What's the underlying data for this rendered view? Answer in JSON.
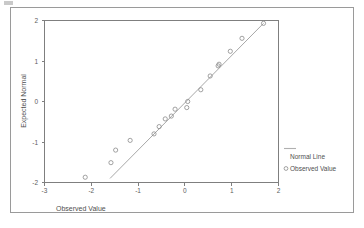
{
  "figure": {
    "background_color": "#ffffff",
    "frame_color": "#9a9a9a",
    "axis_color": "#7f7f7f",
    "marker_color": "#8a8a8a",
    "line_color": "#9d9d9d"
  },
  "legend": {
    "entries": [
      {
        "label": "Normal Line",
        "kind": "line",
        "icon": "line-swatch-icon"
      },
      {
        "label": "Observed Value",
        "kind": "marker",
        "icon": "circle-marker-icon"
      }
    ]
  },
  "chart_data": {
    "type": "scatter",
    "title": "",
    "subtitle": "",
    "xlabel": "Observed Value",
    "ylabel": "Expected Normal",
    "xlim": [
      -3,
      2
    ],
    "ylim": [
      -2,
      2
    ],
    "xticks": [
      -3,
      -2,
      -1,
      0,
      1,
      2
    ],
    "yticks": [
      -2,
      -1,
      0,
      1,
      2
    ],
    "xtick_labels": [
      "-3",
      "-2",
      "-1",
      "0",
      "1",
      "2"
    ],
    "ytick_labels": [
      "-2",
      "-1",
      "0",
      "1",
      "2"
    ],
    "grid": false,
    "legend_position": "right",
    "series": [
      {
        "name": "Observed Value",
        "kind": "scatter",
        "marker": "open-circle",
        "x": [
          -2.13,
          -1.58,
          -1.48,
          -1.17,
          -0.66,
          -0.55,
          -0.42,
          -0.29,
          -0.21,
          0.04,
          0.06,
          0.34,
          0.54,
          0.71,
          0.73,
          0.97,
          1.22,
          1.68
        ],
        "y": [
          -1.87,
          -1.51,
          -1.2,
          -0.96,
          -0.8,
          -0.62,
          -0.43,
          -0.36,
          -0.19,
          -0.15,
          0.0,
          0.29,
          0.63,
          0.88,
          0.92,
          1.24,
          1.56,
          1.93
        ]
      },
      {
        "name": "Normal Line",
        "kind": "line",
        "x": [
          -1.6,
          1.68
        ],
        "y": [
          -1.9,
          1.93
        ]
      }
    ]
  }
}
